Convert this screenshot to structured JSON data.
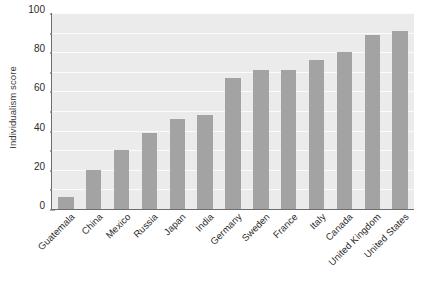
{
  "chart_data": {
    "type": "bar",
    "title": "",
    "xlabel": "",
    "ylabel": "Individualism score",
    "ylim": [
      0,
      100
    ],
    "grid": true,
    "legend": false,
    "bar_color": "#a3a3a3",
    "plot_background": "#ebebeb",
    "gridline_color": "#fbfbfb",
    "axis_color": "#6e6e6e",
    "y_ticks": [
      0,
      20,
      40,
      60,
      80,
      100
    ],
    "y_minor_ticks": [
      10,
      30,
      50,
      70,
      90
    ],
    "categories": [
      "Guatemala",
      "China",
      "Mexico",
      "Russia",
      "Japan",
      "India",
      "Germany",
      "Sweden",
      "France",
      "Italy",
      "Canada",
      "United Kingdom",
      "United States"
    ],
    "values": [
      6,
      20,
      30,
      39,
      46,
      48,
      67,
      71,
      71,
      76,
      80,
      89,
      91
    ]
  }
}
